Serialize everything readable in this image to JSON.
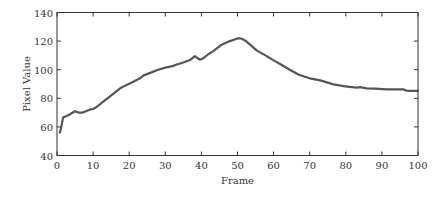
{
  "chart_data": {
    "type": "line",
    "title": "",
    "xlabel": "Frame",
    "ylabel": "Pixel Value",
    "xlim": [
      0,
      100
    ],
    "ylim": [
      40,
      140
    ],
    "xticks": [
      0,
      10,
      20,
      30,
      40,
      50,
      60,
      70,
      80,
      90,
      100
    ],
    "yticks": [
      40,
      60,
      80,
      100,
      120,
      140
    ],
    "grid": false,
    "legend": null,
    "series": [
      {
        "name": "Pixel Value",
        "color": "#555555",
        "x": [
          0.8,
          1.2,
          1.7,
          3,
          5,
          6,
          7,
          8,
          9,
          10,
          11,
          12,
          13,
          14,
          15,
          16,
          17.5,
          19,
          21,
          23,
          24,
          26,
          28,
          30,
          32,
          33,
          35,
          37,
          38.2,
          39,
          39.6,
          40.5,
          42,
          43.3,
          45.6,
          47.9,
          49,
          50.2,
          51,
          52.1,
          53.5,
          55.3,
          58.1,
          60,
          61.8,
          64.5,
          67,
          70,
          72.9,
          75,
          76.6,
          79.4,
          81,
          83.1,
          84,
          85.8,
          88,
          91.4,
          93,
          95.9,
          96.8,
          97.8,
          100
        ],
        "y": [
          56,
          60,
          66.5,
          68,
          71,
          70,
          70,
          71,
          72,
          72.5,
          74,
          76,
          78,
          80,
          82,
          84,
          87,
          89,
          91.5,
          94,
          96,
          98,
          100,
          101.5,
          102.5,
          103.5,
          105,
          107,
          109.5,
          108,
          107,
          108,
          111,
          113,
          117.5,
          120,
          121,
          122,
          121.8,
          120.5,
          117.5,
          113.5,
          109.5,
          106.5,
          104,
          100,
          96.5,
          94,
          92.5,
          91,
          89.7,
          88.5,
          88,
          87.5,
          87.8,
          87,
          86.8,
          86.3,
          86.2,
          86.2,
          85.4,
          85.2,
          85.2
        ]
      }
    ]
  }
}
